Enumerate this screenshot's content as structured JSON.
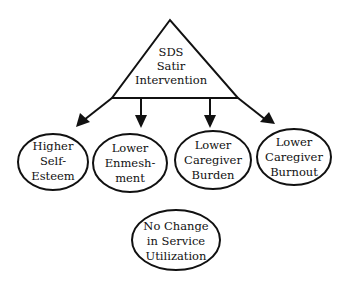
{
  "diagram": {
    "source": {
      "lines": [
        "SDS",
        "Satir",
        "Intervention"
      ]
    },
    "outcomes": [
      {
        "lines": [
          "Higher",
          "Self-",
          "Esteem"
        ]
      },
      {
        "lines": [
          "Lower",
          "Enmesh-",
          "ment"
        ]
      },
      {
        "lines": [
          "Lower",
          "Caregiver",
          "Burden"
        ]
      },
      {
        "lines": [
          "Lower",
          "Caregiver",
          "Burnout"
        ]
      }
    ],
    "no_change": {
      "lines": [
        "No Change",
        "in Service",
        "Utilization"
      ]
    },
    "colors": {
      "stroke": "#111111",
      "fill": "#ffffff"
    }
  }
}
